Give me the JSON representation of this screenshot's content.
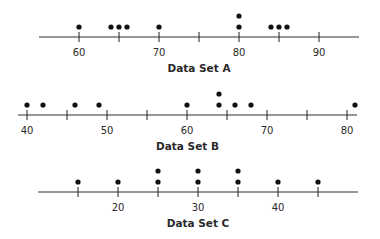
{
  "chart_data": [
    {
      "type": "scatter",
      "subtype": "dot_plot",
      "title": "",
      "xlabel": "Data Set A",
      "ylabel": "",
      "xlim": [
        55,
        95
      ],
      "ticks": [
        60,
        65,
        70,
        75,
        80,
        85,
        90
      ],
      "tick_labels": [
        "60",
        "",
        "70",
        "",
        "80",
        "",
        "90"
      ],
      "values": [
        60,
        64,
        65,
        66,
        70,
        80,
        80,
        84,
        85,
        86
      ],
      "grid": false,
      "legend": null
    },
    {
      "type": "scatter",
      "subtype": "dot_plot",
      "title": "",
      "xlabel": "Data Set B",
      "ylabel": "",
      "xlim": [
        38.75,
        82
      ],
      "ticks": [
        40,
        45,
        50,
        55,
        60,
        65,
        70,
        75,
        80
      ],
      "tick_labels": [
        "40",
        "",
        "50",
        "",
        "60",
        "",
        "70",
        "",
        "80"
      ],
      "values": [
        40,
        42,
        46,
        49,
        60,
        64,
        64,
        66,
        68,
        81
      ],
      "grid": false,
      "legend": null
    },
    {
      "type": "scatter",
      "subtype": "dot_plot",
      "title": "",
      "xlabel": "Data Set C",
      "ylabel": "",
      "xlim": [
        10,
        50
      ],
      "ticks": [
        15,
        20,
        25,
        30,
        35,
        40,
        45
      ],
      "tick_labels": [
        "",
        "20",
        "",
        "30",
        "",
        "40",
        ""
      ],
      "values": [
        15,
        20,
        25,
        25,
        30,
        30,
        35,
        35,
        40,
        45
      ],
      "grid": false,
      "legend": null
    }
  ],
  "labels": {
    "set_a": "Data Set A",
    "set_b": "Data Set B",
    "set_c": "Data Set C"
  },
  "layout": {
    "panels": [
      {
        "axis_y": 37,
        "x0": 39,
        "x1": 359,
        "origin_value": 55,
        "px_per_unit": 8,
        "tick_label_y": 56,
        "title_y": 72
      },
      {
        "axis_y": 115,
        "x0": 18,
        "x1": 357,
        "origin_value": 38.875,
        "px_per_unit": 8,
        "tick_label_y": 134,
        "title_y": 150
      },
      {
        "axis_y": 192,
        "x0": 38,
        "x1": 358,
        "origin_value": 10,
        "px_per_unit": 8,
        "tick_label_y": 211,
        "title_y": 227
      }
    ],
    "dot_radius": 2.6,
    "dot_first_offset": 10,
    "dot_stack_spacing": 11,
    "tick_half": 5
  }
}
